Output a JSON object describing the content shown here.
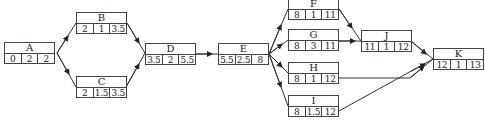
{
  "diagram": {
    "type": "activity-on-node network",
    "node_fields": [
      "earliest_start",
      "duration",
      "earliest_finish"
    ],
    "nodes": [
      {
        "id": "A",
        "x": 4,
        "y": 42,
        "values": [
          "0",
          "2",
          "2"
        ]
      },
      {
        "id": "B",
        "x": 76,
        "y": 12,
        "values": [
          "2",
          "1",
          "3.5"
        ]
      },
      {
        "id": "C",
        "x": 76,
        "y": 76,
        "values": [
          "2",
          "1.5",
          "3.5"
        ]
      },
      {
        "id": "D",
        "x": 145,
        "y": 43,
        "values": [
          "3.5",
          "2",
          "5.5"
        ]
      },
      {
        "id": "E",
        "x": 218,
        "y": 43,
        "values": [
          "5.5",
          "2.5",
          "8"
        ]
      },
      {
        "id": "F",
        "x": 288,
        "y": -2,
        "values": [
          "8",
          "1",
          "11"
        ]
      },
      {
        "id": "G",
        "x": 288,
        "y": 29,
        "values": [
          "8",
          "3",
          "11"
        ]
      },
      {
        "id": "H",
        "x": 288,
        "y": 62,
        "values": [
          "8",
          "1",
          "12"
        ]
      },
      {
        "id": "I",
        "x": 288,
        "y": 95,
        "values": [
          "8",
          "1.5",
          "12"
        ]
      },
      {
        "id": "J",
        "x": 361,
        "y": 30,
        "values": [
          "11",
          "1",
          "12"
        ]
      },
      {
        "id": "K",
        "x": 433,
        "y": 48,
        "values": [
          "12",
          "1",
          "13"
        ]
      }
    ],
    "edges": [
      [
        "A",
        "B"
      ],
      [
        "A",
        "C"
      ],
      [
        "B",
        "D"
      ],
      [
        "C",
        "D"
      ],
      [
        "D",
        "E"
      ],
      [
        "E",
        "F"
      ],
      [
        "E",
        "G"
      ],
      [
        "E",
        "H"
      ],
      [
        "E",
        "I"
      ],
      [
        "F",
        "J"
      ],
      [
        "G",
        "J"
      ],
      [
        "J",
        "K"
      ],
      [
        "H",
        "K"
      ],
      [
        "I",
        "K"
      ]
    ]
  }
}
